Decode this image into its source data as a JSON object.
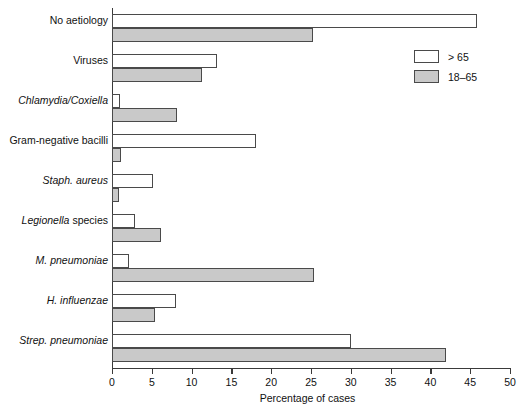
{
  "chart_data": {
    "type": "bar",
    "orientation": "horizontal",
    "title": "",
    "xlabel": "Percentage of cases",
    "ylabel": "",
    "xlim": [
      0,
      50
    ],
    "xticks": [
      0,
      5,
      10,
      15,
      20,
      25,
      30,
      35,
      40,
      45,
      50
    ],
    "grid": false,
    "legend_position": "top-right",
    "categories": [
      "No aetiology",
      "Viruses",
      "Chlamydia/Coxiella",
      "Gram-negative bacilli",
      "Staph. aureus",
      "Legionella species",
      "M. pneumoniae",
      "H. influenzae",
      "Strep. pneumoniae"
    ],
    "category_styles": [
      "roman",
      "roman",
      "italic",
      "roman",
      "italic",
      "italic-partial",
      "italic",
      "italic",
      "italic"
    ],
    "series": [
      {
        "name": "> 65",
        "color": "#ffffff",
        "values": [
          45.8,
          13.2,
          1.0,
          18.1,
          5.1,
          2.9,
          2.1,
          8.1,
          30.0
        ]
      },
      {
        "name": "18–65",
        "color": "#c9c9c9",
        "values": [
          25.3,
          11.3,
          8.2,
          1.1,
          0.9,
          6.1,
          25.4,
          5.4,
          42.0
        ]
      }
    ]
  },
  "legend": {
    "entries": [
      {
        "label": "> 65",
        "swatch": "white"
      },
      {
        "label": "18–65",
        "swatch": "gray"
      }
    ]
  },
  "axis": {
    "x_title": "Percentage of cases",
    "tick_labels": [
      "0",
      "5",
      "10",
      "15",
      "20",
      "25",
      "30",
      "35",
      "40",
      "45",
      "50"
    ]
  },
  "colors": {
    "series_over65": "#ffffff",
    "series_18_65": "#c9c9c9",
    "axis": "#3a3a3a",
    "bar_outline": "#4a4a4a",
    "text": "#111111",
    "background": "#ffffff"
  }
}
